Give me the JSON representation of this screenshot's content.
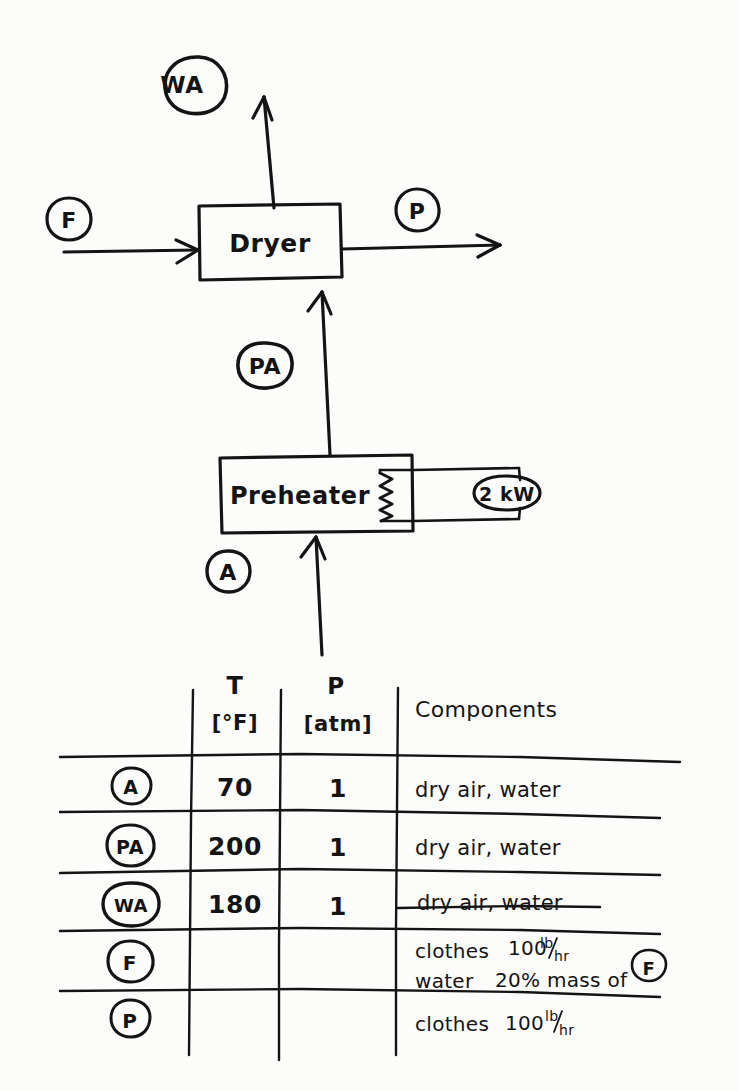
{
  "diagram": {
    "ink_color": "#141414",
    "paper_color": "#fcfcfb",
    "units": [
      {
        "id": "dryer",
        "label": "Dryer"
      },
      {
        "id": "preheater",
        "label": "Preheater"
      }
    ],
    "utility": {
      "label": "2 kW",
      "attached_to": "preheater",
      "symbol": "resistive-heating-coil"
    },
    "streams": [
      {
        "id": "F",
        "label": "F",
        "role": "feed into dryer"
      },
      {
        "id": "P",
        "label": "P",
        "role": "product out of dryer"
      },
      {
        "id": "WA",
        "label": "WA",
        "role": "wet air out of dryer top"
      },
      {
        "id": "PA",
        "label": "PA",
        "role": "preheated air into dryer bottom"
      },
      {
        "id": "A",
        "label": "A",
        "role": "ambient air into preheater bottom"
      }
    ]
  },
  "table": {
    "columns": [
      {
        "key": "stream",
        "header_top": "",
        "header_bottom": ""
      },
      {
        "key": "T",
        "header_top": "T",
        "header_bottom": "[°F]"
      },
      {
        "key": "P",
        "header_top": "P",
        "header_bottom": "[atm]"
      },
      {
        "key": "components",
        "header_top": "Components",
        "header_bottom": ""
      }
    ],
    "rows": [
      {
        "stream": "A",
        "T": "70",
        "P": "1",
        "components": [
          "dry air, water"
        ]
      },
      {
        "stream": "PA",
        "T": "200",
        "P": "1",
        "components": [
          "dry air, water"
        ]
      },
      {
        "stream": "WA",
        "T": "180",
        "P": "1",
        "components": [
          "dry air, water"
        ]
      },
      {
        "stream": "F",
        "T": "",
        "P": "",
        "components": [
          "clothes",
          "water"
        ],
        "component_values": [
          "100 lb/hr",
          "20% mass of F"
        ],
        "value_has_circled_F": true
      },
      {
        "stream": "P",
        "T": "",
        "P": "",
        "components": [
          "clothes"
        ],
        "component_values": [
          "100 lb/hr"
        ]
      }
    ]
  },
  "labels": {
    "lb_per_hr": "lb/hr",
    "lb": "lb",
    "hr": "hr",
    "clothes": "clothes",
    "water": "water",
    "dry_air_water": "dry air, water",
    "pct_mass_of": "20% mass of",
    "qty_100": "100",
    "circled_F": "F"
  }
}
